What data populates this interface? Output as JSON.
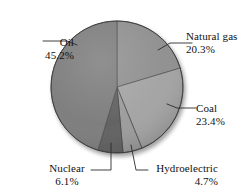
{
  "chart_data": {
    "type": "pie",
    "title": "",
    "subtitle": "",
    "xlabel": "",
    "ylabel": "",
    "legend_position": "none",
    "grid": false,
    "labels_show_percent": true,
    "start_angle_deg": 0,
    "direction": "clockwise",
    "categories": [
      "Natural gas",
      "Coal",
      "Hydroelectric",
      "Nuclear",
      "Oil"
    ],
    "values": [
      20.3,
      23.4,
      4.7,
      6.1,
      45.2
    ],
    "units": "percent",
    "slices": [
      {
        "name": "Natural gas",
        "value": 20.3,
        "label": "Natural gas",
        "percent_text": "20.3%",
        "color": "#8e8e8e",
        "start_deg": 0.0,
        "end_deg": 73.08
      },
      {
        "name": "Coal",
        "value": 23.4,
        "label": "Coal",
        "percent_text": "23.4%",
        "color": "#a2a2a2",
        "start_deg": 73.08,
        "end_deg": 157.32
      },
      {
        "name": "Hydroelectric",
        "value": 4.7,
        "label": "Hydroelectric",
        "percent_text": "4.7%",
        "color": "#9a9a9a",
        "start_deg": 157.32,
        "end_deg": 174.24
      },
      {
        "name": "Nuclear",
        "value": 6.1,
        "label": "Nuclear",
        "percent_text": "6.1%",
        "color": "#5f5f5f",
        "start_deg": 174.24,
        "end_deg": 196.2
      },
      {
        "name": "Oil",
        "value": 45.2,
        "label": "Oil",
        "percent_text": "45.2%",
        "color": "#7b7b7b",
        "start_deg": 196.2,
        "end_deg": 358.92
      }
    ],
    "colors": {
      "natural_gas": "#8e8e8e",
      "coal": "#a2a2a2",
      "hydroelectric": "#9a9a9a",
      "nuclear": "#5f5f5f",
      "oil": "#7b7b7b",
      "outline": "#3a3a3a",
      "leader_line": "#2b2b2b",
      "text": "#111111",
      "background": "#ffffff"
    }
  },
  "labels": {
    "oil": {
      "name": "Oil",
      "percent": "45.2%"
    },
    "natural_gas": {
      "name": "Natural gas",
      "percent": "20.3%"
    },
    "coal": {
      "name": "Coal",
      "percent": "23.4%"
    },
    "nuclear": {
      "name": "Nuclear",
      "percent": "6.1%"
    },
    "hydro": {
      "name": "Hydroelectric",
      "percent": "4.7%"
    }
  }
}
